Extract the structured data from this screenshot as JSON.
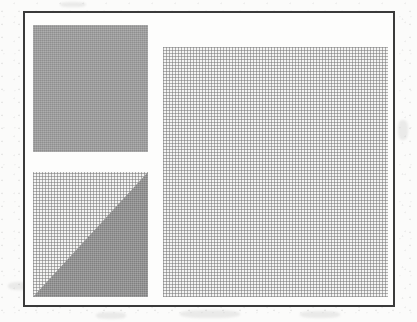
{
  "figure": {
    "title": "",
    "caption": "",
    "background_color": "#fbfbfa",
    "frame": {
      "name": "figure-border",
      "color": "#3a3a3a",
      "thickness_px": 2,
      "x": 23,
      "y": 11,
      "width": 372,
      "height": 296
    },
    "blocks": [
      {
        "id": "block-top-left",
        "label": "",
        "shape": "rectangle",
        "fill": "solid-gray",
        "color": "#9b9b9b",
        "x": 33,
        "y": 25,
        "width": 115,
        "height": 127
      },
      {
        "id": "block-bottom-left",
        "label": "",
        "shape": "rectangle-with-diagonal",
        "fill": "crosshatch",
        "color": "#f4f4f3",
        "overlay_shape": "triangle-lower-right",
        "overlay_color": "#8d8d8d",
        "x": 33,
        "y": 172,
        "width": 115,
        "height": 125
      },
      {
        "id": "block-right",
        "label": "",
        "shape": "rectangle",
        "fill": "crosshatch",
        "color": "#f4f4f3",
        "x": 163,
        "y": 47,
        "width": 225,
        "height": 250
      }
    ]
  }
}
